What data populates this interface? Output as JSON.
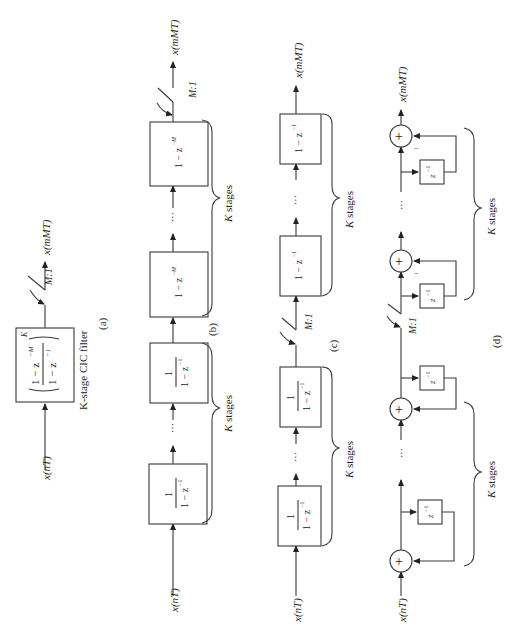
{
  "figure": {
    "orientation": "rotated 90 degrees counter-clockwise",
    "signals": {
      "input": "x(nT)",
      "output": "x(mMT)"
    },
    "decimator": "M:1",
    "panels": [
      {
        "id": "a",
        "caption": "(a)",
        "subtitle": "K-stage CIC filter",
        "block": {
          "num": "1 − z",
          "num_exp": "−M",
          "den": "1 − z",
          "den_exp": "−1",
          "power": "K"
        }
      },
      {
        "id": "b",
        "caption": "(b)",
        "integrator_label": {
          "num": "1",
          "den": "1 − z",
          "den_exp": "−1"
        },
        "comb_label": {
          "text": "1 − z",
          "exp": "−M"
        },
        "stages_label": "K stages",
        "ellipsis": "···"
      },
      {
        "id": "c",
        "caption": "(c)",
        "integrator_label": {
          "num": "1",
          "den": "1 − z",
          "den_exp": "−1"
        },
        "comb_label": {
          "text": "1 − z",
          "exp": "−1"
        },
        "stages_label": "K stages",
        "ellipsis": "···"
      },
      {
        "id": "d",
        "caption": "(d)",
        "delay_label": {
          "text": "z",
          "exp": "−1"
        },
        "adder_symbol": "+",
        "minus_sign": "−",
        "stages_label": "K stages",
        "ellipsis": "···"
      }
    ]
  }
}
